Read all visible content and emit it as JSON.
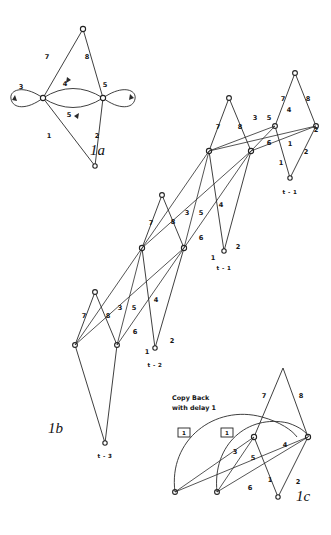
{
  "page": {
    "background": "#ffffff",
    "ink": "#2a2a2a",
    "width": 331,
    "height": 535,
    "kind": "hand-drawn-graph-unfolding-figure"
  },
  "figures": [
    {
      "id": "1a",
      "caption": "1a",
      "description": "Butterfly / lens graph with two self-loops and a bidirectional pair of arcs",
      "nodes": [
        {
          "name": "top",
          "x": 83,
          "y": 29
        },
        {
          "name": "left",
          "x": 43,
          "y": 98
        },
        {
          "name": "right",
          "x": 103,
          "y": 98
        },
        {
          "name": "bottom",
          "x": 95,
          "y": 166
        }
      ],
      "edge_labels": [
        {
          "text": "7",
          "x": 47,
          "y": 57
        },
        {
          "text": "8",
          "x": 87,
          "y": 57
        },
        {
          "text": "3",
          "x": 21,
          "y": 87
        },
        {
          "text": "4",
          "x": 65,
          "y": 84
        },
        {
          "text": "5",
          "x": 105,
          "y": 85
        },
        {
          "text": "1",
          "x": 49,
          "y": 136
        },
        {
          "text": "5",
          "x": 69,
          "y": 115
        },
        {
          "text": "2",
          "x": 97,
          "y": 136
        }
      ]
    },
    {
      "id": "1b",
      "caption": "1b",
      "description": "Time-unfolded version of 1a showing three repeated stages with cross-stage edges and time indices t-1, t-2, t-3",
      "time_labels": [
        {
          "text": "t - 1",
          "x": 224,
          "y": 268
        },
        {
          "text": "t - 2",
          "x": 155,
          "y": 365
        },
        {
          "text": "t - 3",
          "x": 105,
          "y": 456
        }
      ],
      "edge_labels": [
        {
          "text": "7",
          "x": 84,
          "y": 316
        },
        {
          "text": "8",
          "x": 108,
          "y": 316
        },
        {
          "text": "3",
          "x": 120,
          "y": 308
        },
        {
          "text": "5",
          "x": 134,
          "y": 308
        },
        {
          "text": "4",
          "x": 156,
          "y": 300
        },
        {
          "text": "6",
          "x": 135,
          "y": 332
        },
        {
          "text": "1",
          "x": 147,
          "y": 352
        },
        {
          "text": "2",
          "x": 172,
          "y": 341
        },
        {
          "text": "7",
          "x": 151,
          "y": 223
        },
        {
          "text": "8",
          "x": 173,
          "y": 222
        },
        {
          "text": "3",
          "x": 187,
          "y": 213
        },
        {
          "text": "5",
          "x": 201,
          "y": 213
        },
        {
          "text": "4",
          "x": 221,
          "y": 205
        },
        {
          "text": "6",
          "x": 201,
          "y": 238
        },
        {
          "text": "1",
          "x": 213,
          "y": 258
        },
        {
          "text": "2",
          "x": 238,
          "y": 247
        },
        {
          "text": "7",
          "x": 218,
          "y": 127
        },
        {
          "text": "8",
          "x": 240,
          "y": 127
        },
        {
          "text": "3",
          "x": 255,
          "y": 118
        },
        {
          "text": "5",
          "x": 269,
          "y": 118
        },
        {
          "text": "4",
          "x": 289,
          "y": 110
        },
        {
          "text": "6",
          "x": 269,
          "y": 143
        },
        {
          "text": "1",
          "x": 281,
          "y": 163
        },
        {
          "text": "2",
          "x": 306,
          "y": 152
        },
        {
          "text": "7",
          "x": 283,
          "y": 99
        },
        {
          "text": "8",
          "x": 308,
          "y": 99
        },
        {
          "text": "1",
          "x": 290,
          "y": 144
        },
        {
          "text": "2",
          "x": 316,
          "y": 130
        }
      ]
    },
    {
      "id": "1c",
      "caption": "1c",
      "description": "Folded back version with copy-back arcs carrying a unit delay",
      "annotation": {
        "line1": "Copy Back",
        "line2": "with delay 1",
        "x": 172,
        "y": 398
      },
      "delay_boxes": [
        {
          "text": "1",
          "x": 185,
          "y": 434
        },
        {
          "text": "1",
          "x": 228,
          "y": 434
        }
      ],
      "edge_labels": [
        {
          "text": "7",
          "x": 264,
          "y": 396
        },
        {
          "text": "8",
          "x": 301,
          "y": 396
        },
        {
          "text": "3",
          "x": 235,
          "y": 452
        },
        {
          "text": "5",
          "x": 253,
          "y": 458
        },
        {
          "text": "4",
          "x": 285,
          "y": 445
        },
        {
          "text": "6",
          "x": 250,
          "y": 488
        },
        {
          "text": "1",
          "x": 270,
          "y": 480
        },
        {
          "text": "2",
          "x": 298,
          "y": 482
        }
      ]
    }
  ]
}
